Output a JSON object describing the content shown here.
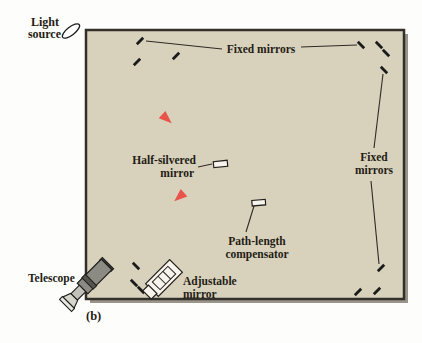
{
  "figure": {
    "type": "physics-apparatus-diagram",
    "caption": "(b)"
  },
  "labels": {
    "light_source": {
      "line1": "Light",
      "line2": "source"
    },
    "fixed_mirrors_top": "Fixed mirrors",
    "fixed_mirrors_right": {
      "line1": "Fixed",
      "line2": "mirrors"
    },
    "half_silvered": {
      "line1": "Half-silvered",
      "line2": "mirror"
    },
    "path_length": {
      "line1": "Path-length",
      "line2": "compensator"
    },
    "adjustable": {
      "line1": "Adjustable",
      "line2": "mirror"
    },
    "telescope": "Telescope"
  },
  "colors": {
    "beam": "#e8534a",
    "beam_halo": "#f3a59d",
    "box_fill": "#d8d2bd",
    "box_border": "#33302b",
    "shadow": "#9a948a",
    "label": "#241c14",
    "tick": "#1a1a1a",
    "leader": "#2f2a24",
    "device_fill": "#f6f4ec"
  }
}
